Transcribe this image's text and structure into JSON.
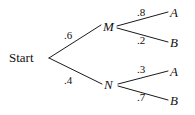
{
  "diagram": {
    "type": "probability-tree",
    "root": {
      "label": "Start"
    },
    "level1": [
      {
        "label": "M",
        "probability": ".6"
      },
      {
        "label": "N",
        "probability": ".4"
      }
    ],
    "level2": [
      {
        "parent": "M",
        "label": "A",
        "probability": ".8"
      },
      {
        "parent": "M",
        "label": "B",
        "probability": ".2"
      },
      {
        "parent": "N",
        "label": "A",
        "probability": ".3"
      },
      {
        "parent": "N",
        "label": "B",
        "probability": ".7"
      }
    ],
    "colors": {
      "line": "#1a1a1a",
      "text": "#111111",
      "background": "#ffffff"
    }
  }
}
